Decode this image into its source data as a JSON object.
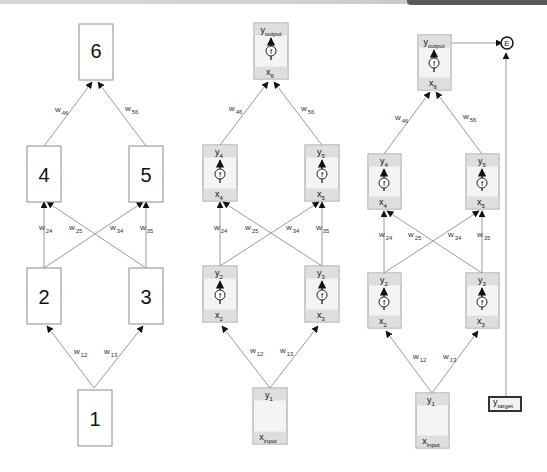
{
  "colors": {
    "edge": "#9a9a9a",
    "node_fill": "#f4f4f4",
    "band": "#dedede",
    "arrow": "#111111"
  },
  "panel1": {
    "nodes": {
      "n1": "1",
      "n2": "2",
      "n3": "3",
      "n4": "4",
      "n5": "5",
      "n6": "6"
    },
    "weights": {
      "w12": {
        "base": "w",
        "sub": "12"
      },
      "w13": {
        "base": "w",
        "sub": "13"
      },
      "w24": {
        "base": "w",
        "sub": "24"
      },
      "w25": {
        "base": "w",
        "sub": "25"
      },
      "w34": {
        "base": "w",
        "sub": "34"
      },
      "w35": {
        "base": "w",
        "sub": "35"
      },
      "w46": {
        "base": "w",
        "sub": "46"
      },
      "w56": {
        "base": "w",
        "sub": "56"
      }
    }
  },
  "panel2": {
    "nodes": {
      "n1": {
        "y": "y",
        "y_sub": "1",
        "x": "x",
        "x_sub": "input"
      },
      "n2": {
        "y": "y",
        "y_sub": "2",
        "f": "f",
        "x": "x",
        "x_sub": "2"
      },
      "n3": {
        "y": "y",
        "y_sub": "3",
        "f": "f",
        "x": "x",
        "x_sub": "3"
      },
      "n4": {
        "y": "y",
        "y_sub": "4",
        "f": "f",
        "x": "x",
        "x_sub": "4"
      },
      "n5": {
        "y": "y",
        "y_sub": "5",
        "f": "f",
        "x": "x",
        "x_sub": "5"
      },
      "n6": {
        "y": "y",
        "y_sub": "output",
        "f": "f",
        "x": "x",
        "x_sub": "6"
      }
    },
    "weights": {
      "w12": {
        "base": "w",
        "sub": "12"
      },
      "w13": {
        "base": "w",
        "sub": "13"
      },
      "w24": {
        "base": "w",
        "sub": "24"
      },
      "w25": {
        "base": "w",
        "sub": "25"
      },
      "w34": {
        "base": "w",
        "sub": "34"
      },
      "w35": {
        "base": "w",
        "sub": "35"
      },
      "w46": {
        "base": "w",
        "sub": "46"
      },
      "w56": {
        "base": "w",
        "sub": "56"
      }
    }
  },
  "panel3": {
    "nodes": {
      "n1": {
        "y": "y",
        "y_sub": "1",
        "x": "x",
        "x_sub": "input"
      },
      "n2": {
        "y": "y",
        "y_sub": "2",
        "f": "f",
        "x": "x",
        "x_sub": "2"
      },
      "n3": {
        "y": "y",
        "y_sub": "3",
        "f": "f",
        "x": "x",
        "x_sub": "3"
      },
      "n4": {
        "y": "y",
        "y_sub": "4",
        "f": "f",
        "x": "x",
        "x_sub": "4"
      },
      "n5": {
        "y": "y",
        "y_sub": "5",
        "f": "f",
        "x": "x",
        "x_sub": "5"
      },
      "n6": {
        "y": "y",
        "y_sub": "output",
        "f": "f",
        "x": "x",
        "x_sub": "6"
      }
    },
    "weights": {
      "w12": {
        "base": "w",
        "sub": "12"
      },
      "w13": {
        "base": "w",
        "sub": "13"
      },
      "w24": {
        "base": "w",
        "sub": "24"
      },
      "w25": {
        "base": "w",
        "sub": "25"
      },
      "w34": {
        "base": "w",
        "sub": "34"
      },
      "w35": {
        "base": "w",
        "sub": "35"
      },
      "w46": {
        "base": "w",
        "sub": "46"
      },
      "w56": {
        "base": "w",
        "sub": "56"
      }
    },
    "error_node": "E",
    "target": {
      "y": "y",
      "y_sub": "target"
    }
  }
}
